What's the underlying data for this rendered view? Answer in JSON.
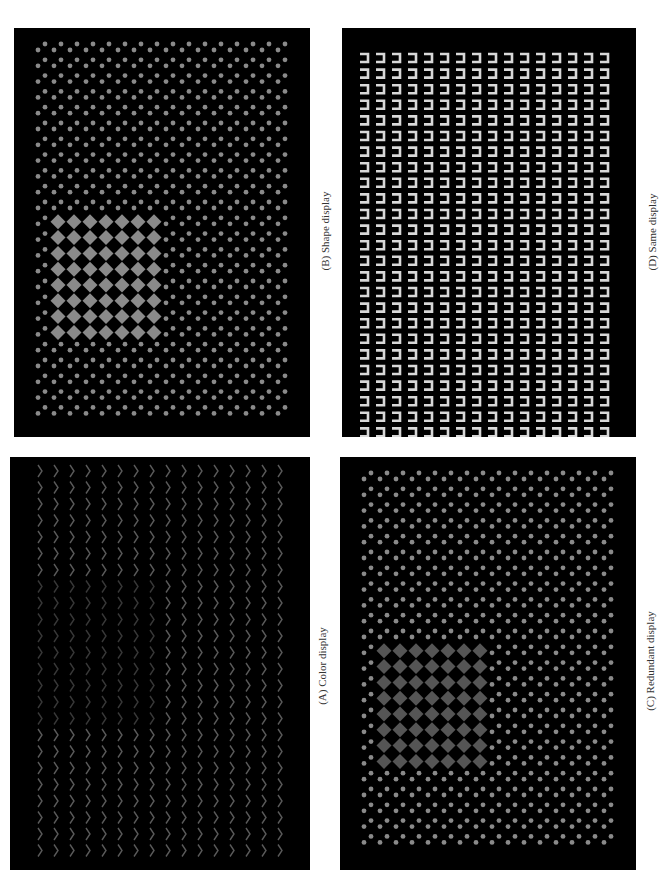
{
  "figure": {
    "orientation": "rotated-90-ccw",
    "panels": [
      {
        "id": "B",
        "caption": "(B) Shape display",
        "position": "top-left",
        "stimulus": "gray dots in staggered pairs; target region of larger gray diamonds",
        "colors": {
          "background": "#000000",
          "distractor": "#8a8a8a",
          "target": "#8a8a8a"
        }
      },
      {
        "id": "D",
        "caption": "(D) Same display",
        "position": "top-right",
        "stimulus": "uniform grid of light-gray bracket (⊐) glyphs",
        "colors": {
          "background": "#000000",
          "element": "#d8d8d8"
        }
      },
      {
        "id": "A",
        "caption": "(A) Color display",
        "position": "bottom-left",
        "stimulus": "grid of chevron (›) glyphs; target region slightly darker",
        "colors": {
          "background": "#000000",
          "distractor": "#5a5a5a",
          "target": "#383838"
        }
      },
      {
        "id": "C",
        "caption": "(C) Redundant display",
        "position": "bottom-right",
        "stimulus": "gray dots in staggered pairs; target region of darker gray diamonds",
        "colors": {
          "background": "#000000",
          "distractor": "#8a8a8a",
          "target": "#555555"
        }
      }
    ]
  }
}
